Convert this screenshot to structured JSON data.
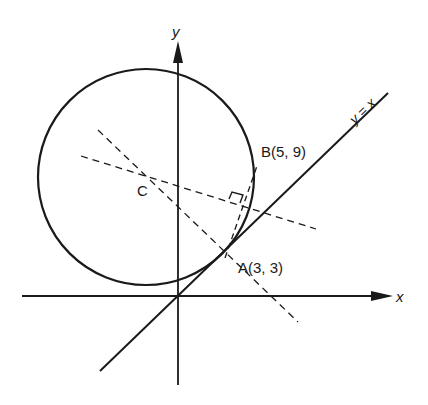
{
  "diagram": {
    "type": "coordinate-geometry",
    "colors": {
      "ink": "#1a1a1a",
      "background": "#ffffff"
    },
    "axes": {
      "x_label": "x",
      "y_label": "y"
    },
    "line": {
      "label": "y = x"
    },
    "points": {
      "A": {
        "label": "A(3, 3)"
      },
      "B": {
        "label": "B(5, 9)"
      },
      "C": {
        "label": "C"
      }
    },
    "elements": [
      "circle centered at C passing through A and B, tangent to y = x at A",
      "dashed line through A perpendicular to y = x (passes through C)",
      "dashed perpendicular bisector of chord AB (passes through C)",
      "dashed chord AB with right-angle marker"
    ]
  }
}
